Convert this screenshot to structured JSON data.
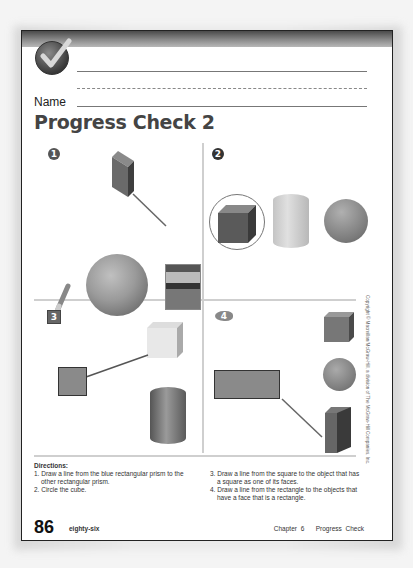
{
  "page": {
    "name_label": "Name",
    "title": "Progress Check 2",
    "copyright": "Copyright © Macmillan/McGraw-Hill, a division of The McGraw-Hill Companies, Inc.",
    "page_number": "86",
    "page_number_words": "eighty-six",
    "chapter": "Chapter 6",
    "section": "Progress Check"
  },
  "problems": [
    {
      "number": "1",
      "badge_shape": "circle",
      "objects": [
        "blue-rectangular-prism",
        "ball",
        "crayon",
        "crayon-box"
      ],
      "answer": "line from rectangular prism to crayon box"
    },
    {
      "number": "2",
      "badge_shape": "apple",
      "objects": [
        "cube",
        "cylinder",
        "sphere"
      ],
      "answer": "cube circled"
    },
    {
      "number": "3",
      "badge_shape": "square",
      "objects": [
        "square",
        "cube",
        "cylinder"
      ],
      "answer": "line from square to cube"
    },
    {
      "number": "4",
      "badge_shape": "fish",
      "objects": [
        "rectangle",
        "cube",
        "sphere",
        "rectangular-prism"
      ],
      "answer": "line from rectangle to rectangular prism"
    }
  ],
  "directions": {
    "heading": "Directions:",
    "items": [
      "1.  Draw a line from the blue rectangular prism to the",
      "     other rectangular prism.",
      "2.  Circle the cube.",
      "3.  Draw a line from the square to the object that has",
      "     a square as one of its faces.",
      "4.  Draw a line from the rectangle to the objects that",
      "     have a face that is a rectangle."
    ]
  },
  "colors": {
    "ink": "#222222",
    "title": "#444444",
    "divider": "#cfcfcf"
  }
}
